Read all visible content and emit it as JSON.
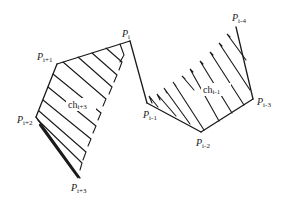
{
  "diagram": {
    "type": "polygon-chain-hatched-regions",
    "vertices": [
      {
        "id": "P_i",
        "base": "P",
        "sub": "i",
        "x": 130,
        "y": 41,
        "label_x": 122,
        "label_y": 37
      },
      {
        "id": "P_i+1",
        "base": "P",
        "sub": "i+1",
        "x": 57,
        "y": 64,
        "label_x": 37,
        "label_y": 60
      },
      {
        "id": "P_i+2",
        "base": "P",
        "sub": "i+2",
        "x": 36,
        "y": 117,
        "label_x": 17,
        "label_y": 123
      },
      {
        "id": "P_i+3",
        "base": "P",
        "sub": "i+3",
        "x": 80,
        "y": 178,
        "label_x": 71,
        "label_y": 191
      },
      {
        "id": "P_i-1",
        "base": "P",
        "sub": "i-1",
        "x": 147,
        "y": 103,
        "label_x": 143,
        "label_y": 118
      },
      {
        "id": "P_i-2",
        "base": "P",
        "sub": "i-2",
        "x": 201,
        "y": 132,
        "label_x": 196,
        "label_y": 146
      },
      {
        "id": "P_i-3",
        "base": "P",
        "sub": "i-3",
        "x": 253,
        "y": 99,
        "label_x": 257,
        "label_y": 105
      },
      {
        "id": "P_i-4",
        "base": "P",
        "sub": "i-4",
        "x": 236,
        "y": 27,
        "label_x": 232,
        "label_y": 21
      }
    ],
    "regions": [
      {
        "id": "ch_i+3",
        "label_base": "ch",
        "label_sub": "i+3",
        "label_x": 70,
        "label_y": 108
      },
      {
        "id": "ch_i-1",
        "label_base": "ch",
        "label_sub": "i-1",
        "label_x": 204,
        "label_y": 93
      }
    ],
    "colors": {
      "stroke": "#1a1a1a",
      "background": "#ffffff"
    }
  },
  "labels": {
    "P_i": {
      "base": "P",
      "sub": "i"
    },
    "P_i+1": {
      "base": "P",
      "sub": "i+1"
    },
    "P_i+2": {
      "base": "P",
      "sub": "i+2"
    },
    "P_i+3": {
      "base": "P",
      "sub": "i+3"
    },
    "P_i-1": {
      "base": "P",
      "sub": "i-1"
    },
    "P_i-2": {
      "base": "P",
      "sub": "i-2"
    },
    "P_i-3": {
      "base": "P",
      "sub": "i-3"
    },
    "P_i-4": {
      "base": "P",
      "sub": "i-4"
    },
    "ch_i+3": {
      "base": "ch",
      "sub": "i+3"
    },
    "ch_i-1": {
      "base": "ch",
      "sub": "i-1"
    }
  }
}
